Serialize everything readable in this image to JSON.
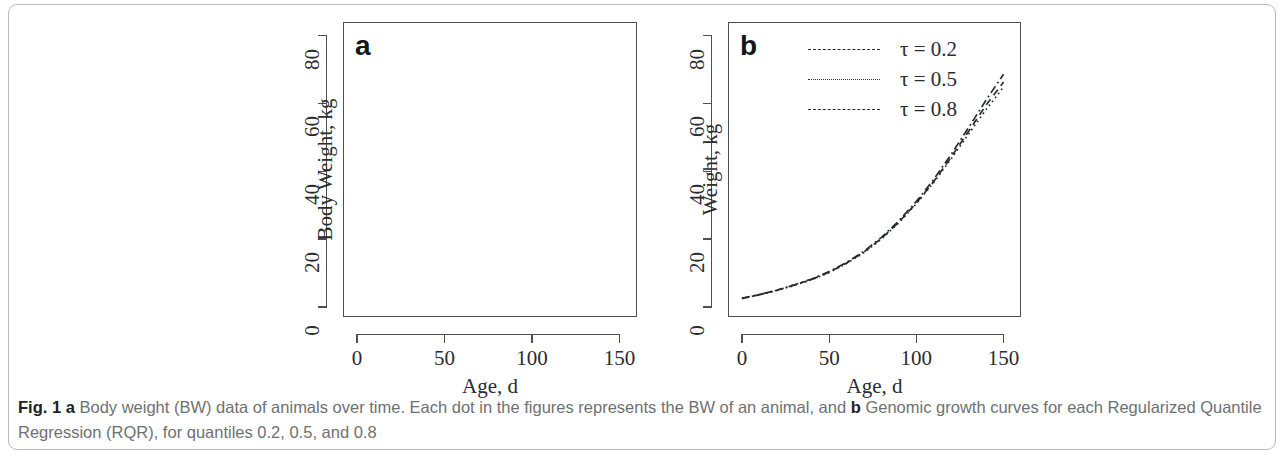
{
  "figure": {
    "caption_prefix": "Fig. 1 a",
    "caption_text_1": " Body weight (BW) data of animals over time. Each dot in the figures represents the BW of an animal, and ",
    "caption_bold_b": "b",
    "caption_text_2": " Genomic growth curves for each Regularized Quantile Regression (RQR), for quantiles 0.2, 0.5, and 0.8",
    "border_color": "#b9bcbe",
    "ink_color": "#2a2c2e"
  },
  "chart_data": [
    {
      "type": "scatter",
      "panel_letter": "a",
      "title": "",
      "xlabel": "Age, d",
      "ylabel": "Body Weight, kg",
      "xlim": [
        -8,
        160
      ],
      "ylim": [
        -3,
        84
      ],
      "xticks": [
        0,
        50,
        100,
        150
      ],
      "xtick_labels": [
        "0",
        "50",
        "100",
        "150"
      ],
      "yticks": [
        0,
        20,
        40,
        60,
        80
      ],
      "ytick_labels": [
        "0",
        "20",
        "40",
        "60",
        "80"
      ],
      "grid": false,
      "legend": "none",
      "marker": "open-circle",
      "description": "Body weight of animals measured at 7 discrete ages; vertical strips of overplotted open circles.",
      "clusters": [
        {
          "age": 0,
          "min": 0.8,
          "max": 2.2,
          "n": 40
        },
        {
          "age": 21,
          "min": 2.4,
          "max": 7.3,
          "n": 40
        },
        {
          "age": 42,
          "min": 2.2,
          "max": 12.8,
          "n": 40
        },
        {
          "age": 63,
          "min": 6.8,
          "max": 23.2,
          "n": 40
        },
        {
          "age": 77,
          "min": 9.8,
          "max": 30.2,
          "n": 40
        },
        {
          "age": 105,
          "min": 12.3,
          "max": 46.2,
          "n": 44
        },
        {
          "age": 150,
          "min": 52.6,
          "max": 79.8,
          "n": 40
        }
      ],
      "outliers": [
        {
          "age": 150,
          "value": 39.2
        }
      ]
    },
    {
      "type": "line",
      "panel_letter": "b",
      "title": "",
      "xlabel": "Age, d",
      "ylabel": "Weight, kg",
      "xlim": [
        -8,
        160
      ],
      "ylim": [
        -3,
        84
      ],
      "xticks": [
        0,
        50,
        100,
        150
      ],
      "xtick_labels": [
        "0",
        "50",
        "100",
        "150"
      ],
      "yticks": [
        0,
        20,
        40,
        60,
        80
      ],
      "ytick_labels": [
        "0",
        "20",
        "40",
        "60",
        "80"
      ],
      "grid": false,
      "legend_position": "top-center",
      "x": [
        0,
        10,
        20,
        30,
        40,
        50,
        60,
        70,
        80,
        90,
        100,
        110,
        120,
        130,
        140,
        150
      ],
      "series": [
        {
          "name": "τ = 0.2",
          "style": "dashed",
          "values": [
            2.5,
            3.6,
            4.9,
            6.4,
            8.1,
            10.2,
            12.9,
            16.2,
            20.2,
            25.0,
            30.6,
            37.0,
            44.2,
            51.8,
            59.5,
            66.3
          ]
        },
        {
          "name": "τ = 0.5",
          "style": "dotted",
          "values": [
            2.5,
            3.5,
            4.8,
            6.3,
            8.0,
            10.1,
            12.8,
            16.0,
            20.0,
            24.8,
            30.4,
            36.7,
            43.7,
            51.0,
            58.2,
            64.8
          ]
        },
        {
          "name": "τ = 0.8",
          "style": "dash-dot",
          "values": [
            2.5,
            3.6,
            4.9,
            6.5,
            8.2,
            10.4,
            13.1,
            16.4,
            20.5,
            25.4,
            31.1,
            37.6,
            45.0,
            52.9,
            61.0,
            68.6
          ]
        }
      ]
    }
  ],
  "panel_a": {
    "letter": "a",
    "ylabel": "Body Weight, kg",
    "xlabel": "Age, d",
    "xtick_labels": [
      "0",
      "50",
      "100",
      "150"
    ],
    "ytick_labels": [
      "0",
      "20",
      "40",
      "60",
      "80"
    ]
  },
  "panel_b": {
    "letter": "b",
    "ylabel": "Weight, kg",
    "xlabel": "Age, d",
    "xtick_labels": [
      "0",
      "50",
      "100",
      "150"
    ],
    "ytick_labels": [
      "0",
      "20",
      "40",
      "60",
      "80"
    ],
    "legend": [
      {
        "label": "τ = 0.2",
        "style": "dashed"
      },
      {
        "label": "τ = 0.5",
        "style": "dotted"
      },
      {
        "label": "τ = 0.8",
        "style": "dash-dot"
      }
    ]
  }
}
